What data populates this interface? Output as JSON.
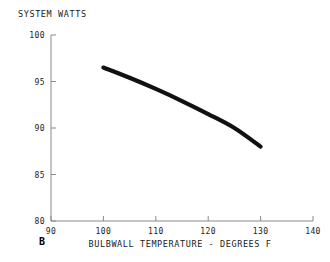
{
  "chart_data": {
    "type": "line",
    "title": "",
    "panel_label": "B",
    "ylabel": "SYSTEM WATTS",
    "xlabel": "BULBWALL TEMPERATURE - DEGREES F",
    "xlim": [
      90,
      140
    ],
    "ylim": [
      80,
      100
    ],
    "xticks": [
      90,
      100,
      110,
      120,
      130,
      140
    ],
    "yticks": [
      80,
      85,
      90,
      95,
      100
    ],
    "xtick_labels": [
      "90",
      "100",
      "110",
      "120",
      "130",
      "140"
    ],
    "ytick_labels": [
      "80",
      "85",
      "90",
      "95",
      "100"
    ],
    "grid": false,
    "legend": "none",
    "line_color": "#111111",
    "line_width": 4.2,
    "series": [
      {
        "name": "system watts vs bulbwall temperature",
        "x": [
          100,
          105,
          110,
          115,
          120,
          125,
          130
        ],
        "y": [
          96.5,
          95.4,
          94.2,
          92.9,
          91.5,
          90.0,
          88.0
        ]
      }
    ]
  },
  "axis_frame_color": "#8a8a8a",
  "background_color": "#ffffff"
}
